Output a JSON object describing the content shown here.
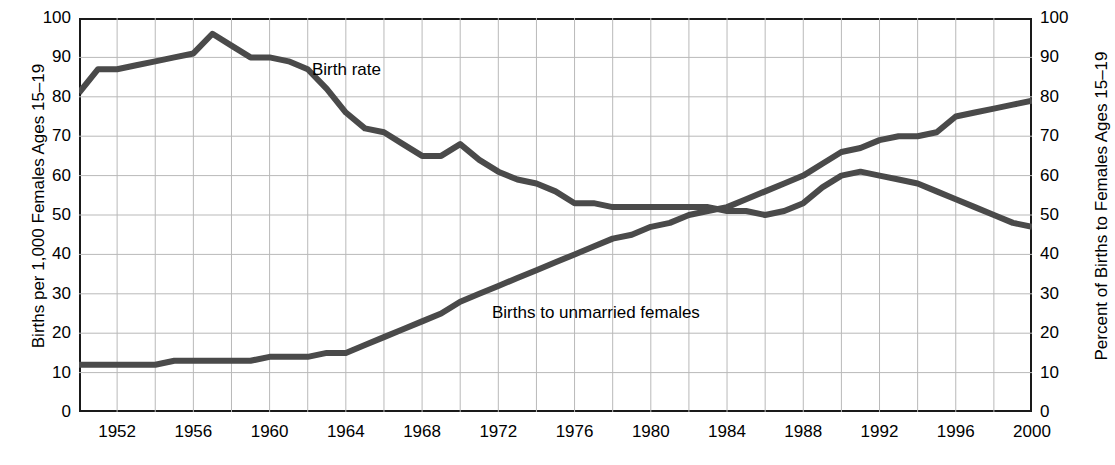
{
  "chart_data": {
    "type": "line",
    "title": "",
    "xlabel": "",
    "ylabel": "Births per 1,000 Females Ages 15–19",
    "ylabel_right": "Percent of Births to Females Ages 15–19",
    "xlim": [
      1950,
      2000
    ],
    "ylim": [
      0,
      100
    ],
    "ylim_right": [
      0,
      100
    ],
    "grid": true,
    "legend_position": "inline-annotations",
    "yticks": [
      0,
      10,
      20,
      30,
      40,
      50,
      60,
      70,
      80,
      90,
      100
    ],
    "ytick_labels": [
      "0",
      "10",
      "20",
      "30",
      "40",
      "50",
      "60",
      "70",
      "80",
      "90",
      "100"
    ],
    "yticks_right": [
      0,
      10,
      20,
      30,
      40,
      50,
      60,
      70,
      80,
      90,
      100
    ],
    "ytick_labels_right": [
      "0",
      "10",
      "20",
      "30",
      "40",
      "50",
      "60",
      "70",
      "80",
      "90",
      "100"
    ],
    "xticks": [
      1952,
      1956,
      1960,
      1964,
      1968,
      1972,
      1976,
      1980,
      1984,
      1988,
      1992,
      1996,
      2000
    ],
    "xtick_labels": [
      "1952",
      "1956",
      "1960",
      "1964",
      "1968",
      "1972",
      "1976",
      "1980",
      "1984",
      "1988",
      "1992",
      "1996",
      "2000"
    ],
    "gridline_x_interval": 2,
    "gridline_y_interval": 10,
    "line_color": "#4a4a4a",
    "frame_color": "#1a1a1a",
    "grid_color": "#b9b9b9",
    "series": [
      {
        "name": "Birth rate",
        "axis": "left",
        "units": "Births per 1,000 Females Ages 15-19",
        "x": [
          1950,
          1951,
          1952,
          1953,
          1954,
          1955,
          1956,
          1957,
          1958,
          1959,
          1960,
          1961,
          1962,
          1963,
          1964,
          1965,
          1966,
          1967,
          1968,
          1969,
          1970,
          1971,
          1972,
          1973,
          1974,
          1975,
          1976,
          1977,
          1978,
          1979,
          1980,
          1981,
          1982,
          1983,
          1984,
          1985,
          1986,
          1987,
          1988,
          1989,
          1990,
          1991,
          1992,
          1993,
          1994,
          1995,
          1996,
          1997,
          1998,
          1999,
          2000
        ],
        "values": [
          81,
          87,
          87,
          88,
          89,
          90,
          91,
          96,
          93,
          90,
          90,
          89,
          87,
          82,
          76,
          72,
          71,
          68,
          65,
          65,
          68,
          64,
          61,
          59,
          58,
          56,
          53,
          53,
          52,
          52,
          52,
          52,
          52,
          52,
          51,
          51,
          50,
          51,
          53,
          57,
          60,
          61,
          60,
          59,
          58,
          56,
          54,
          52,
          50,
          48,
          47
        ]
      },
      {
        "name": "Births to unmarried females",
        "axis": "right",
        "units": "Percent of Births to Females Ages 15-19",
        "x": [
          1950,
          1951,
          1952,
          1953,
          1954,
          1955,
          1956,
          1957,
          1958,
          1959,
          1960,
          1961,
          1962,
          1963,
          1964,
          1965,
          1966,
          1967,
          1968,
          1969,
          1970,
          1971,
          1972,
          1973,
          1974,
          1975,
          1976,
          1977,
          1978,
          1979,
          1980,
          1981,
          1982,
          1983,
          1984,
          1985,
          1986,
          1987,
          1988,
          1989,
          1990,
          1991,
          1992,
          1993,
          1994,
          1995,
          1996,
          1997,
          1998,
          1999,
          2000
        ],
        "values": [
          12,
          12,
          12,
          12,
          12,
          13,
          13,
          13,
          13,
          13,
          14,
          14,
          14,
          15,
          15,
          17,
          19,
          21,
          23,
          25,
          28,
          30,
          32,
          34,
          36,
          38,
          40,
          42,
          44,
          45,
          47,
          48,
          50,
          51,
          52,
          54,
          56,
          58,
          60,
          63,
          66,
          67,
          69,
          70,
          70,
          71,
          75,
          76,
          77,
          78,
          79
        ]
      }
    ],
    "annotations": [
      {
        "text": "Birth rate",
        "series": "Birth rate",
        "x_approx": 1962,
        "y_approx": 85
      },
      {
        "text": "Births to unmarried females",
        "series": "Births to unmarried females",
        "x_approx": 1974,
        "y_approx": 25
      }
    ]
  }
}
